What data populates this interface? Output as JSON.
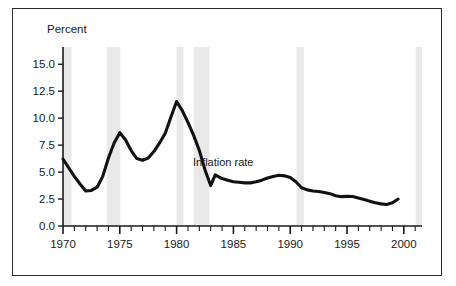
{
  "figure": {
    "border_color": "#2b2b2b",
    "background": "#ffffff"
  },
  "chart_data": {
    "type": "line",
    "title": "",
    "subtitle": "",
    "xlabel": "",
    "ylabel": "Percent",
    "ylabel_position": "top-left",
    "grid": false,
    "legend": "none",
    "annotations": [
      {
        "text": "Inflation rate",
        "x": 1984.1,
        "y": 5.6
      }
    ],
    "xlim": [
      1970,
      2001.6
    ],
    "ylim": [
      0.0,
      16.6
    ],
    "y_ticks": [
      0.0,
      2.5,
      5.0,
      7.5,
      10.0,
      12.5,
      15.0
    ],
    "y_tick_labels": [
      "0.0",
      "2.5",
      "5.0",
      "7.5",
      "10.0",
      "12.5",
      "15.0"
    ],
    "x_ticks": [
      1970,
      1971,
      1972,
      1973,
      1974,
      1975,
      1976,
      1977,
      1978,
      1979,
      1980,
      1981,
      1982,
      1983,
      1984,
      1985,
      1986,
      1987,
      1988,
      1989,
      1990,
      1991,
      1992,
      1993,
      1994,
      1995,
      1996,
      1997,
      1998,
      1999,
      2000,
      2001
    ],
    "x_tick_labels_major": [
      {
        "value": 1970,
        "label": "1970"
      },
      {
        "value": 1975,
        "label": "1975"
      },
      {
        "value": 1980,
        "label": "1980"
      },
      {
        "value": 1985,
        "label": "1985"
      },
      {
        "value": 1990,
        "label": "1990"
      },
      {
        "value": 1995,
        "label": "1995"
      },
      {
        "value": 2000,
        "label": "2000"
      }
    ],
    "line_color": "#111111",
    "line_width": 3.1,
    "series": [
      {
        "name": "Inflation rate",
        "x": [
          1970.0,
          1970.5,
          1971.0,
          1971.5,
          1972.0,
          1972.5,
          1973.0,
          1973.5,
          1974.0,
          1974.5,
          1975.0,
          1975.5,
          1976.0,
          1976.5,
          1977.0,
          1977.5,
          1978.0,
          1978.5,
          1979.0,
          1979.5,
          1980.0,
          1980.5,
          1981.0,
          1981.5,
          1982.0,
          1982.5,
          1983.0,
          1983.4,
          1984.0,
          1984.5,
          1985.0,
          1985.5,
          1986.0,
          1986.5,
          1987.0,
          1987.5,
          1988.0,
          1988.5,
          1989.0,
          1989.5,
          1990.0,
          1990.5,
          1991.0,
          1991.5,
          1992.0,
          1992.5,
          1993.0,
          1993.5,
          1994.0,
          1994.5,
          1995.0,
          1995.5,
          1996.0,
          1996.5,
          1997.0,
          1997.5,
          1998.0,
          1998.5,
          1999.0,
          1999.5
        ],
        "y": [
          6.2,
          5.4,
          4.6,
          3.9,
          3.25,
          3.3,
          3.6,
          4.6,
          6.3,
          7.7,
          8.65,
          8.0,
          7.0,
          6.25,
          6.1,
          6.3,
          6.9,
          7.7,
          8.6,
          10.1,
          11.55,
          10.7,
          9.6,
          8.4,
          7.0,
          5.2,
          3.75,
          4.75,
          4.4,
          4.25,
          4.1,
          4.05,
          4.0,
          4.0,
          4.1,
          4.25,
          4.45,
          4.6,
          4.7,
          4.65,
          4.5,
          4.1,
          3.55,
          3.35,
          3.25,
          3.2,
          3.1,
          3.0,
          2.8,
          2.72,
          2.75,
          2.73,
          2.6,
          2.45,
          2.3,
          2.15,
          2.05,
          2.0,
          2.15,
          2.5
        ]
      }
    ],
    "shaded_bands": {
      "color": "#e9e9e9",
      "label": "recession-band",
      "ranges": [
        [
          1970.0,
          1970.75
        ],
        [
          1973.85,
          1975.05
        ],
        [
          1980.0,
          1980.6
        ],
        [
          1981.5,
          1982.9
        ],
        [
          1990.55,
          1991.2
        ],
        [
          2001.05,
          2001.6
        ]
      ]
    }
  }
}
